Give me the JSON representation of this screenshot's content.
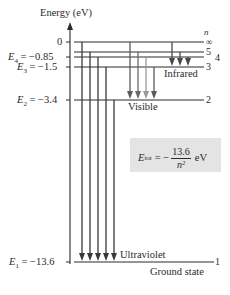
{
  "title": "Energy (eV)",
  "n_label": "n",
  "colors": {
    "line": "#2a2a2a",
    "arrow_dark": "#3a3a3a",
    "arrow_mid": "#6a6a6a",
    "arrow_light": "#9a9a9a",
    "box": "#e4e4e4"
  },
  "levels": [
    {
      "n": "∞",
      "energy_label": "0",
      "energy": 0,
      "y": 42
    },
    {
      "n": "5",
      "energy_label": "",
      "energy": -0.54,
      "y": 52
    },
    {
      "n": "4",
      "energy_label": "E4 = −0.85",
      "energy": -0.85,
      "y": 57
    },
    {
      "n": "3",
      "energy_label": "E3 = −1.5",
      "energy": -1.5,
      "y": 67
    },
    {
      "n": "2",
      "energy_label": "E2 = −3.4",
      "energy": -3.4,
      "y": 100
    },
    {
      "n": "1",
      "energy_label": "E1 = −13.6",
      "energy": -13.6,
      "y": 262
    }
  ],
  "labels": {
    "e4_sym": "E",
    "e4_sub": "4",
    "e4_val": " = −0.85",
    "e3_sym": "E",
    "e3_sub": "3",
    "e3_val": " = −1.5",
    "e2_sym": "E",
    "e2_sub": "2",
    "e2_val": " = −3.4",
    "e1_sym": "E",
    "e1_sub": "1",
    "e1_val": " = −13.6",
    "zero": "0",
    "n_inf": "∞",
    "n5": "5",
    "n4": "4",
    "n3": "3",
    "n2": "2",
    "n1": "1",
    "infrared": "Infrared",
    "visible": "Visible",
    "ultraviolet": "Ultraviolet",
    "ground_state": "Ground state"
  },
  "series": [
    {
      "name": "Ultraviolet",
      "final_n": 1,
      "initial_n": [
        "∞",
        5,
        4,
        3,
        2
      ]
    },
    {
      "name": "Visible",
      "final_n": 2,
      "initial_n": [
        "∞",
        5,
        4,
        3
      ]
    },
    {
      "name": "Infrared",
      "final_n": 3,
      "initial_n": [
        "∞",
        5,
        4
      ]
    }
  ],
  "formula": {
    "lhs_sym": "E",
    "lhs_sub": "tot",
    "equals": "= −",
    "numerator": "13.6",
    "denominator": "n²",
    "unit": "eV"
  }
}
